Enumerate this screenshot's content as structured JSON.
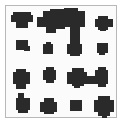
{
  "image": {
    "description": "Binary pixel pattern: a framed 4x4 arrangement of dark blobs, some merged",
    "colors": {
      "background": "#ffffff",
      "frame": "#b8b8b8",
      "blob": "#2a2a2a"
    }
  },
  "blobs": [
    {
      "id": "r1c1",
      "rects": [
        [
          13,
          12,
          18,
          10
        ],
        [
          11,
          15,
          22,
          7
        ],
        [
          16,
          22,
          12,
          6
        ]
      ]
    },
    {
      "id": "r1c2-c3-merged",
      "rects": [
        [
          37,
          17,
          18,
          10
        ],
        [
          43,
          11,
          10,
          8
        ],
        [
          50,
          9,
          15,
          20
        ],
        [
          46,
          25,
          10,
          8
        ],
        [
          60,
          11,
          25,
          16
        ],
        [
          64,
          8,
          14,
          6
        ],
        [
          80,
          18,
          5,
          8
        ],
        [
          70,
          26,
          10,
          8
        ]
      ]
    },
    {
      "id": "r1c4",
      "rects": [
        [
          95,
          19,
          18,
          8
        ],
        [
          98,
          16,
          10,
          14
        ],
        [
          100,
          28,
          6,
          3
        ]
      ]
    },
    {
      "id": "r2c1",
      "rects": [
        [
          16,
          40,
          12,
          10
        ],
        [
          24,
          46,
          6,
          5
        ]
      ]
    },
    {
      "id": "r2c2",
      "rects": [
        [
          43,
          44,
          10,
          10
        ],
        [
          46,
          42,
          5,
          3
        ]
      ]
    },
    {
      "id": "r2c3",
      "rects": [
        [
          70,
          34,
          10,
          22
        ],
        [
          67,
          44,
          15,
          10
        ]
      ]
    },
    {
      "id": "r2c4",
      "rects": [
        [
          97,
          43,
          11,
          10
        ],
        [
          99,
          52,
          6,
          3
        ]
      ]
    },
    {
      "id": "r3c1",
      "rects": [
        [
          13,
          72,
          17,
          12
        ],
        [
          16,
          69,
          10,
          20
        ]
      ]
    },
    {
      "id": "r3c2",
      "rects": [
        [
          43,
          70,
          13,
          10
        ],
        [
          46,
          67,
          8,
          16
        ]
      ]
    },
    {
      "id": "r3c3-c4-merged",
      "rects": [
        [
          67,
          72,
          20,
          12
        ],
        [
          72,
          68,
          12,
          18
        ],
        [
          84,
          76,
          14,
          8
        ],
        [
          95,
          70,
          13,
          14
        ],
        [
          98,
          67,
          8,
          20
        ],
        [
          74,
          84,
          6,
          4
        ]
      ]
    },
    {
      "id": "r4c1",
      "rects": [
        [
          16,
          98,
          14,
          12
        ],
        [
          18,
          93,
          6,
          6
        ],
        [
          18,
          108,
          10,
          5
        ]
      ]
    },
    {
      "id": "r4c2",
      "rects": [
        [
          40,
          102,
          17,
          10
        ],
        [
          44,
          98,
          10,
          16
        ]
      ]
    },
    {
      "id": "r4c3",
      "rects": [
        [
          70,
          100,
          12,
          11
        ]
      ]
    },
    {
      "id": "r4c4",
      "rects": [
        [
          94,
          100,
          20,
          12
        ],
        [
          98,
          96,
          12,
          20
        ],
        [
          102,
          114,
          5,
          4
        ]
      ]
    }
  ]
}
